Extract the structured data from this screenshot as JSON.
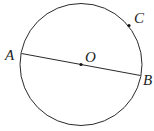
{
  "diagram": {
    "type": "geometry-circle",
    "colors": {
      "stroke": "#2a2a2a",
      "point": "#111111",
      "background": "#ffffff"
    },
    "circle": {
      "center_label": "O",
      "cx": 81,
      "cy": 64.5,
      "r": 61.5
    },
    "diameter": {
      "from": "A",
      "to": "B"
    },
    "points": [
      {
        "label": "A",
        "x": 21.5,
        "y": 53.5,
        "label_x": 6,
        "label_y": 60,
        "dot": false
      },
      {
        "label": "B",
        "x": 140.5,
        "y": 75.5,
        "label_x": 143,
        "label_y": 85,
        "dot": false
      },
      {
        "label": "O",
        "x": 81,
        "y": 64.5,
        "label_x": 85,
        "label_y": 62,
        "dot": true
      },
      {
        "label": "C",
        "x": 129,
        "y": 25.5,
        "label_x": 134,
        "label_y": 22,
        "dot": true
      }
    ]
  }
}
